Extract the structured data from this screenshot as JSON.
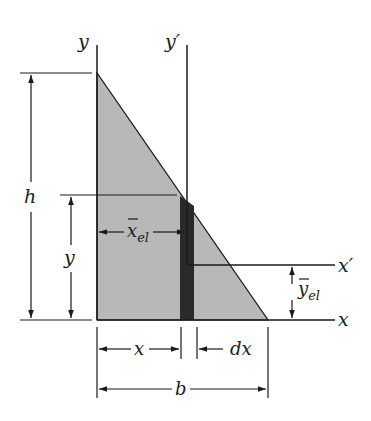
{
  "diagram": {
    "colors": {
      "background": "#ffffff",
      "triangle_fill": "#b8b8b8",
      "strip_fill": "#2a2a2a",
      "line": "#1a1a1a"
    },
    "labels": {
      "y_axis": "y",
      "y_prime_axis": "y′",
      "x_axis": "x",
      "x_prime_axis": "x′",
      "height": "h",
      "y_dim": "y",
      "x_el_main": "x",
      "x_el_sub": "el",
      "y_el_main": "y",
      "y_el_sub": "el",
      "x_dim": "x",
      "dx_dim": "dx",
      "b_dim": "b"
    }
  }
}
